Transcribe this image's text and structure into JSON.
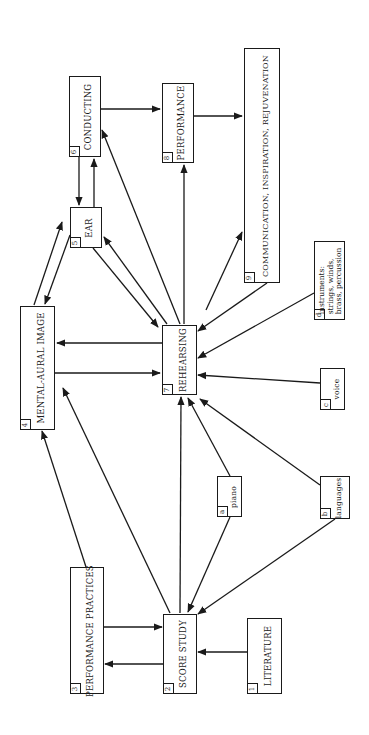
{
  "diagram": {
    "title": "",
    "orientation": "rotated-90-ccw",
    "colors": {
      "stroke": "#1a1a1a",
      "background": "#ffffff"
    },
    "nodes": [
      {
        "id": "1",
        "number": "1",
        "label": "LITERATURE",
        "x": 247,
        "y": 618,
        "w": 35,
        "h": 76
      },
      {
        "id": "2",
        "number": "2",
        "label": "SCORE STUDY",
        "x": 163,
        "y": 614,
        "w": 34,
        "h": 80
      },
      {
        "id": "3",
        "number": "3",
        "label": "PERFORMANCE PRACTICES",
        "x": 70,
        "y": 567,
        "w": 34,
        "h": 127
      },
      {
        "id": "4",
        "number": "4",
        "label": "MENTAL-AURAL IMAGE",
        "x": 20,
        "y": 306,
        "w": 35,
        "h": 124
      },
      {
        "id": "5",
        "number": "5",
        "label": "EAR",
        "x": 70,
        "y": 207,
        "w": 32,
        "h": 41
      },
      {
        "id": "6",
        "number": "6",
        "label": "CONDUCTING",
        "x": 69,
        "y": 76,
        "w": 32,
        "h": 81
      },
      {
        "id": "7",
        "number": "7",
        "label": "REHEARSING",
        "x": 162,
        "y": 325,
        "w": 35,
        "h": 70
      },
      {
        "id": "8",
        "number": "8",
        "label": "PERFORMANCE",
        "x": 162,
        "y": 83,
        "w": 32,
        "h": 80
      },
      {
        "id": "9",
        "number": "9",
        "label": "COMMUNICATION, INSPIRATION, REJUVENATION",
        "x": 244,
        "y": 48,
        "w": 36,
        "h": 235
      },
      {
        "id": "a",
        "number": "a",
        "label": "piano",
        "x": 217,
        "y": 476,
        "w": 25,
        "h": 41
      },
      {
        "id": "b",
        "number": "b",
        "label": "languages",
        "x": 320,
        "y": 476,
        "w": 30,
        "h": 43
      },
      {
        "id": "c",
        "number": "c",
        "label": "voice",
        "x": 320,
        "y": 368,
        "w": 25,
        "h": 42
      },
      {
        "id": "d",
        "number": "d",
        "label_lines": [
          "instruments:",
          "strings, winds,",
          "brass, percussion"
        ],
        "x": 314,
        "y": 241,
        "w": 31,
        "h": 79
      }
    ],
    "edges": [
      {
        "from": "1",
        "to": "2",
        "x1": 247,
        "y1": 652,
        "x2": 198,
        "y2": 652
      },
      {
        "from": "3",
        "to": "2",
        "x1": 104,
        "y1": 627,
        "x2": 162,
        "y2": 627
      },
      {
        "from": "2",
        "to": "3",
        "x1": 163,
        "y1": 664,
        "x2": 105,
        "y2": 664
      },
      {
        "from": "a",
        "to": "2",
        "x1": 230,
        "y1": 517,
        "x2": 188,
        "y2": 612
      },
      {
        "from": "b",
        "to": "2",
        "x1": 335,
        "y1": 519,
        "x2": 198,
        "y2": 614
      },
      {
        "from": "2",
        "to": "4",
        "x1": 170,
        "y1": 613,
        "x2": 63,
        "y2": 388
      },
      {
        "from": "3",
        "to": "4",
        "x1": 86,
        "y1": 567,
        "x2": 42,
        "y2": 431
      },
      {
        "from": "2",
        "to": "7",
        "x1": 180,
        "y1": 613,
        "x2": 181,
        "y2": 397
      },
      {
        "from": "a",
        "to": "7",
        "x1": 230,
        "y1": 476,
        "x2": 188,
        "y2": 398
      },
      {
        "from": "b",
        "to": "7",
        "x1": 320,
        "y1": 485,
        "x2": 200,
        "y2": 399
      },
      {
        "from": "c",
        "to": "7",
        "x1": 320,
        "y1": 383,
        "x2": 198,
        "y2": 375
      },
      {
        "from": "d",
        "to": "7",
        "x1": 314,
        "y1": 293,
        "x2": 198,
        "y2": 358
      },
      {
        "from": "9",
        "to": "7",
        "x1": 267,
        "y1": 283,
        "x2": 198,
        "y2": 331
      },
      {
        "from": "7",
        "to": "9",
        "x1": 206,
        "y1": 310,
        "x2": 242,
        "y2": 232
      },
      {
        "from": "7",
        "to": "8",
        "x1": 184,
        "y1": 324,
        "x2": 184,
        "y2": 165
      },
      {
        "from": "7",
        "to": "6",
        "x1": 180,
        "y1": 324,
        "x2": 102,
        "y2": 130
      },
      {
        "from": "7",
        "to": "4",
        "x1": 162,
        "y1": 343,
        "x2": 57,
        "y2": 343
      },
      {
        "from": "4",
        "to": "7",
        "x1": 55,
        "y1": 373,
        "x2": 160,
        "y2": 373
      },
      {
        "from": "5",
        "to": "7",
        "x1": 93,
        "y1": 248,
        "x2": 158,
        "y2": 327
      },
      {
        "from": "7",
        "to": "5",
        "x1": 167,
        "y1": 324,
        "x2": 104,
        "y2": 237
      },
      {
        "from": "4",
        "to": "5",
        "x1": 34,
        "y1": 305,
        "x2": 62,
        "y2": 222
      },
      {
        "from": "5",
        "to": "4",
        "x1": 70,
        "y1": 235,
        "x2": 45,
        "y2": 304
      },
      {
        "from": "6",
        "to": "5",
        "x1": 79,
        "y1": 157,
        "x2": 79,
        "y2": 205
      },
      {
        "from": "5",
        "to": "6",
        "x1": 94,
        "y1": 207,
        "x2": 94,
        "y2": 159
      },
      {
        "from": "6",
        "to": "8",
        "x1": 101,
        "y1": 109,
        "x2": 160,
        "y2": 109
      },
      {
        "from": "8",
        "to": "9",
        "x1": 194,
        "y1": 116,
        "x2": 242,
        "y2": 116
      }
    ]
  }
}
